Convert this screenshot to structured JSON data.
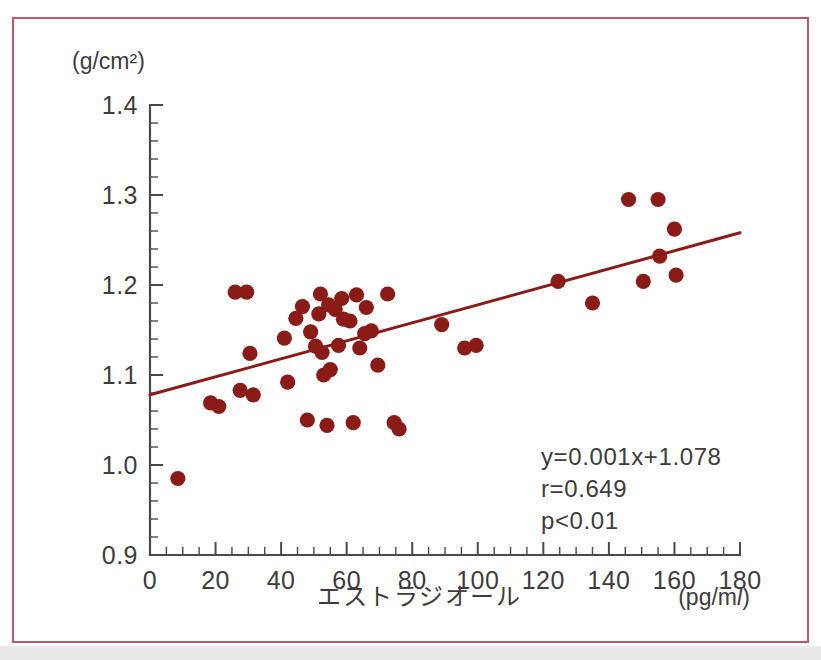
{
  "figure": {
    "border_color": "#c1566a",
    "background": "#ffffff"
  },
  "chart_data": {
    "type": "scatter",
    "title": "",
    "subtitle": "",
    "xlabel": "エストラジオール",
    "xunit": "(pg/ml)",
    "ylabel": "",
    "yunit": "(g/cm²)",
    "xlim": [
      0,
      180
    ],
    "ylim": [
      0.9,
      1.4
    ],
    "x_major_tick_step": 20,
    "x_minor_tick_step": 5,
    "y_major_tick_step": 0.1,
    "y_minor_tick_step": 0.02,
    "x_tick_labels": [
      "0",
      "20",
      "40",
      "60",
      "80",
      "100",
      "120",
      "140",
      "160",
      "180"
    ],
    "y_tick_labels": [
      "0.9",
      "1.0",
      "1.1",
      "1.2",
      "1.3",
      "1.4"
    ],
    "grid": false,
    "legend": null,
    "marker_color": "#8a1b16",
    "line_color": "#8a1b16",
    "regression": {
      "slope": 0.001,
      "intercept": 1.078,
      "x_start": 0,
      "x_end": 180,
      "y_start": 1.078,
      "y_end": 1.258
    },
    "annotations": {
      "equation": "y=0.001x+1.078",
      "correlation": "r=0.649",
      "pvalue": "p<0.01"
    },
    "points": [
      [
        8.5,
        0.985
      ],
      [
        18.5,
        1.069
      ],
      [
        21.0,
        1.065
      ],
      [
        26.0,
        1.192
      ],
      [
        27.5,
        1.083
      ],
      [
        29.5,
        1.192
      ],
      [
        30.5,
        1.124
      ],
      [
        31.5,
        1.078
      ],
      [
        41.0,
        1.141
      ],
      [
        42.0,
        1.092
      ],
      [
        44.5,
        1.163
      ],
      [
        46.5,
        1.176
      ],
      [
        48.0,
        1.05
      ],
      [
        49.0,
        1.148
      ],
      [
        50.5,
        1.132
      ],
      [
        51.5,
        1.168
      ],
      [
        52.0,
        1.19
      ],
      [
        52.5,
        1.125
      ],
      [
        53.0,
        1.1
      ],
      [
        54.0,
        1.044
      ],
      [
        54.5,
        1.178
      ],
      [
        55.0,
        1.106
      ],
      [
        56.5,
        1.173
      ],
      [
        57.5,
        1.133
      ],
      [
        58.5,
        1.185
      ],
      [
        59.0,
        1.162
      ],
      [
        61.0,
        1.16
      ],
      [
        62.0,
        1.047
      ],
      [
        63.0,
        1.189
      ],
      [
        64.0,
        1.13
      ],
      [
        65.5,
        1.146
      ],
      [
        66.0,
        1.175
      ],
      [
        67.5,
        1.149
      ],
      [
        69.5,
        1.111
      ],
      [
        72.5,
        1.19
      ],
      [
        74.5,
        1.047
      ],
      [
        76.0,
        1.04
      ],
      [
        89.0,
        1.156
      ],
      [
        96.0,
        1.13
      ],
      [
        99.5,
        1.133
      ],
      [
        124.5,
        1.204
      ],
      [
        135.0,
        1.18
      ],
      [
        146.0,
        1.295
      ],
      [
        150.5,
        1.204
      ],
      [
        155.0,
        1.295
      ],
      [
        155.5,
        1.232
      ],
      [
        160.0,
        1.262
      ],
      [
        160.5,
        1.211
      ]
    ]
  }
}
